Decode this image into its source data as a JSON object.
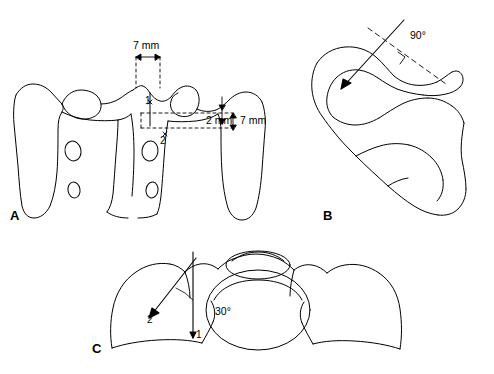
{
  "figure": {
    "title": "",
    "type": "line-drawing-anatomical-diagram",
    "panels": [
      {
        "id": "A",
        "letter": "A",
        "view": "posterior view of cervical vertebra (lateral mass screw entry points)",
        "annotations": [
          {
            "name": "width-7mm",
            "text": "7 mm"
          },
          {
            "name": "offset-2mm",
            "text": "2 mm"
          },
          {
            "name": "height-7mm",
            "text": "7 mm"
          },
          {
            "name": "point-1",
            "text": "1"
          },
          {
            "name": "point-2",
            "text": "2"
          }
        ]
      },
      {
        "id": "B",
        "letter": "B",
        "view": "lateral view with 90 degree sagittal trajectory",
        "annotations": [
          {
            "name": "angle-90",
            "text": "90°"
          }
        ]
      },
      {
        "id": "C",
        "letter": "C",
        "view": "axial view with 30 degree lateral angulation",
        "annotations": [
          {
            "name": "angle-30",
            "text": "30°"
          },
          {
            "name": "trajectory-2",
            "text": "2"
          },
          {
            "name": "trajectory-1",
            "text": "1"
          }
        ]
      }
    ],
    "colors": {
      "stroke": "#000000",
      "background": "#ffffff"
    }
  }
}
